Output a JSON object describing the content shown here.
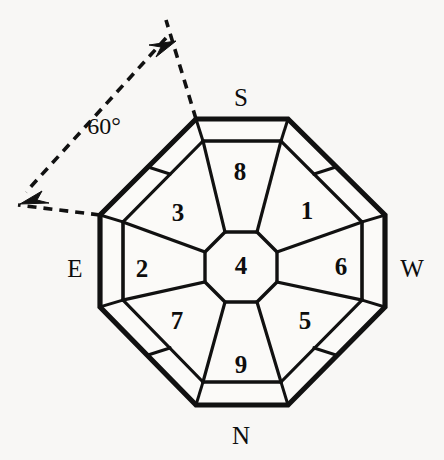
{
  "figure": {
    "type": "octagonal-compass-plan-diagram",
    "background_color": "#f8f7f5",
    "stroke_color": "#111111",
    "fill_color": "#fbfaf8",
    "width": 444,
    "height": 460
  },
  "compass_labels": [
    {
      "name": "south",
      "text": "S",
      "x": 241,
      "y": 97
    },
    {
      "name": "west",
      "text": "W",
      "x": 412,
      "y": 268
    },
    {
      "name": "north",
      "text": "N",
      "x": 241,
      "y": 435
    },
    {
      "name": "east",
      "text": "E",
      "x": 75,
      "y": 268
    }
  ],
  "annotation": {
    "angle_text": "60°",
    "angle_x": 104,
    "angle_y": 126,
    "arrow_upper_tip": {
      "x": 172,
      "y": 48
    },
    "arrow_lower_tip": {
      "x": 28,
      "y": 198
    }
  },
  "cells": [
    {
      "name": "cell-1",
      "label": "1",
      "x": 307,
      "y": 210
    },
    {
      "name": "cell-2",
      "label": "2",
      "x": 142,
      "y": 268
    },
    {
      "name": "cell-3",
      "label": "3",
      "x": 178,
      "y": 212
    },
    {
      "name": "cell-4",
      "label": "4",
      "x": 241,
      "y": 265
    },
    {
      "name": "cell-5",
      "label": "5",
      "x": 305,
      "y": 320
    },
    {
      "name": "cell-6",
      "label": "6",
      "x": 341,
      "y": 266
    },
    {
      "name": "cell-7",
      "label": "7",
      "x": 177,
      "y": 320
    },
    {
      "name": "cell-8",
      "label": "8",
      "x": 240,
      "y": 171
    },
    {
      "name": "cell-9",
      "label": "9",
      "x": 241,
      "y": 364
    }
  ]
}
